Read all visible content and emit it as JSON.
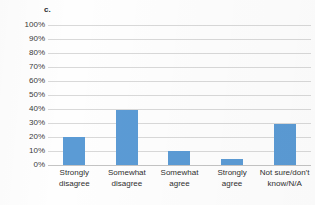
{
  "panel": {
    "label": "c."
  },
  "chart_data": {
    "type": "bar",
    "title": "",
    "subtitle": "",
    "xlabel": "",
    "ylabel": "",
    "categories": [
      "Strongly disagree",
      "Somewhat disagree",
      "Somewhat agree",
      "Strongly agree",
      "Not sure/don’t know/N/A"
    ],
    "category_lines": [
      [
        "Strongly",
        "disagree"
      ],
      [
        "Somewhat",
        "disagree"
      ],
      [
        "Somewhat",
        "agree"
      ],
      [
        "Strongly",
        "agree"
      ],
      [
        "Not sure/don’t",
        "know/N/A"
      ]
    ],
    "values": [
      20,
      39,
      10,
      4,
      29
    ],
    "value_labels": [
      "20%",
      "39%",
      "10%",
      "4%",
      "29%"
    ],
    "ylim": [
      0,
      100
    ],
    "ytick_values": [
      100,
      90,
      80,
      70,
      60,
      50,
      40,
      30,
      20,
      10,
      0
    ],
    "ytick_labels": [
      "100%",
      "90%",
      "80%",
      "70%",
      "60%",
      "50%",
      "40%",
      "30%",
      "20%",
      "10%",
      "0%"
    ],
    "grid": true,
    "legend": false,
    "legend_position": "none",
    "bar_color": "#5b9bd5",
    "grid_color": "#d9d9d9",
    "axis_color": "#c4c4c4"
  }
}
